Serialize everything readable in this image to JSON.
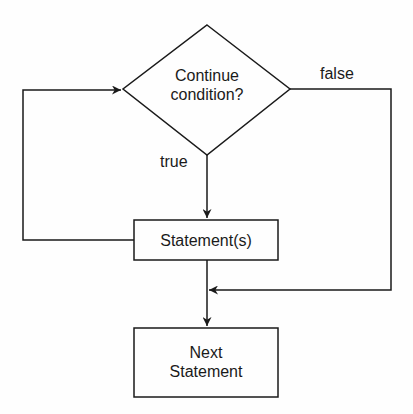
{
  "diagram": {
    "type": "flowchart",
    "decision": {
      "line1": "Continue",
      "line2": "condition?"
    },
    "true_label": "true",
    "false_label": "false",
    "statement_box": "Statement(s)",
    "next_box": {
      "line1": "Next",
      "line2": "Statement"
    },
    "colors": {
      "stroke": "#1a1a1a",
      "background": "#fefefe"
    }
  }
}
